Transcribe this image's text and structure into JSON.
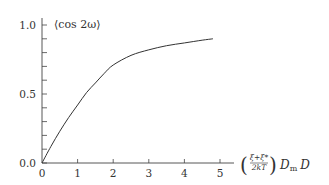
{
  "chart_data": {
    "type": "line",
    "title": "",
    "ylabel": "⟨cos 2ω⟩",
    "xlabel": "((ξ+ξ*)/(2kT)) D_m D",
    "xlabel_parts": {
      "num": "ξ+ξ*",
      "den": "2kT",
      "tail_D": "D",
      "tail_sub": "m",
      "tail_end": "D"
    },
    "xlim": [
      0,
      5.4
    ],
    "ylim": [
      0,
      1.05
    ],
    "xticks": [
      "0",
      "1",
      "2",
      "3",
      "4",
      "5"
    ],
    "yticks": [
      "0.0",
      "0.5",
      "1.0"
    ],
    "y_minor_step": 0.1,
    "grid": false,
    "series": [
      {
        "name": "⟨cos 2ω⟩",
        "x": [
          0,
          0.25,
          0.5,
          0.75,
          1.0,
          1.25,
          1.5,
          1.75,
          2.0,
          2.5,
          3.0,
          3.5,
          4.0,
          4.5,
          4.8
        ],
        "values": [
          0,
          0.12,
          0.23,
          0.33,
          0.42,
          0.51,
          0.58,
          0.65,
          0.71,
          0.78,
          0.82,
          0.85,
          0.87,
          0.89,
          0.9
        ]
      }
    ]
  }
}
